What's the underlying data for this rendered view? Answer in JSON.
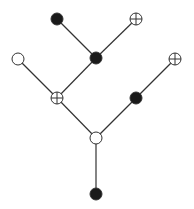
{
  "diagram": {
    "type": "tree",
    "colors": {
      "edge": "#333333",
      "filled": "#1a1a1a",
      "open_fill": "#ffffff",
      "stroke": "#333333"
    },
    "node_radius": 6,
    "nodes": [
      {
        "id": "root",
        "kind": "filled",
        "x": 96,
        "y": 194
      },
      {
        "id": "branch",
        "kind": "open",
        "x": 96,
        "y": 138
      },
      {
        "id": "left-junction",
        "kind": "crossed",
        "x": 57,
        "y": 98
      },
      {
        "id": "right-mid",
        "kind": "filled",
        "x": 136,
        "y": 98
      },
      {
        "id": "left-leaf",
        "kind": "open",
        "x": 18,
        "y": 59
      },
      {
        "id": "center-junction",
        "kind": "filled",
        "x": 96,
        "y": 58
      },
      {
        "id": "right-leaf",
        "kind": "crossed",
        "x": 175,
        "y": 59
      },
      {
        "id": "top-left-leaf",
        "kind": "filled",
        "x": 57,
        "y": 19
      },
      {
        "id": "top-right-leaf",
        "kind": "crossed",
        "x": 136,
        "y": 19
      }
    ],
    "edges": [
      [
        "root",
        "branch"
      ],
      [
        "branch",
        "left-junction"
      ],
      [
        "branch",
        "right-mid"
      ],
      [
        "left-junction",
        "left-leaf"
      ],
      [
        "left-junction",
        "center-junction"
      ],
      [
        "right-mid",
        "right-leaf"
      ],
      [
        "center-junction",
        "top-left-leaf"
      ],
      [
        "center-junction",
        "top-right-leaf"
      ]
    ]
  }
}
